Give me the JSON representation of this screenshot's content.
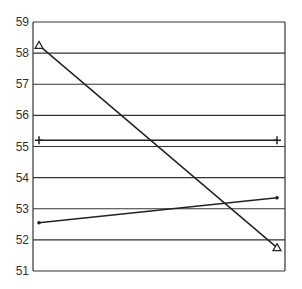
{
  "chart_data": {
    "type": "line",
    "title": "",
    "xlabel": "",
    "ylabel": "",
    "categories": [
      "start",
      "end"
    ],
    "x_tick_labels": [],
    "ylim": [
      51,
      59
    ],
    "y_ticks": [
      51,
      52,
      53,
      54,
      55,
      56,
      57,
      58,
      59
    ],
    "grid": "horizontal",
    "legend": "none",
    "series": [
      {
        "name": "triangle-series",
        "marker": "triangle",
        "values": [
          58.25,
          51.75
        ]
      },
      {
        "name": "plus-series",
        "marker": "plus",
        "values": [
          55.2,
          55.2
        ]
      },
      {
        "name": "dot-series",
        "marker": "dot",
        "values": [
          52.55,
          53.35
        ]
      }
    ]
  }
}
